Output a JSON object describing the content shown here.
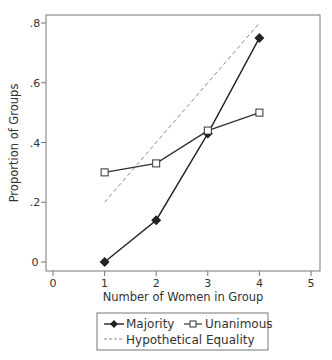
{
  "chart_data": {
    "type": "line",
    "title": "",
    "xlabel": "Number of Women in Group",
    "ylabel": "Proportion of Groups",
    "xlim": [
      0,
      5
    ],
    "ylim": [
      0,
      0.8
    ],
    "x_ticks": [
      0,
      1,
      2,
      3,
      4,
      5
    ],
    "x_tick_labels": [
      "0",
      "1",
      "2",
      "3",
      "4",
      "5"
    ],
    "y_ticks": [
      0,
      0.2,
      0.4,
      0.6,
      0.8
    ],
    "y_tick_labels": [
      "0",
      ".2",
      ".4",
      ".6",
      ".8"
    ],
    "grid": false,
    "legend_position": "bottom",
    "series": [
      {
        "name": "Majority",
        "x": [
          1,
          2,
          3,
          4
        ],
        "values": [
          0.0,
          0.14,
          0.43,
          0.75
        ],
        "marker": "diamond-filled",
        "line": "solid",
        "color": "#222222"
      },
      {
        "name": "Unanimous",
        "x": [
          1,
          2,
          3,
          4
        ],
        "values": [
          0.3,
          0.33,
          0.44,
          0.5
        ],
        "marker": "square-hollow",
        "line": "solid",
        "color": "#333333"
      },
      {
        "name": "Hypothetical Equality",
        "x": [
          1,
          4
        ],
        "values": [
          0.2,
          0.8
        ],
        "marker": "none",
        "line": "dashed",
        "color": "#888888"
      }
    ]
  },
  "legend": {
    "items": [
      "Majority",
      "Unanimous",
      "Hypothetical Equality"
    ]
  }
}
